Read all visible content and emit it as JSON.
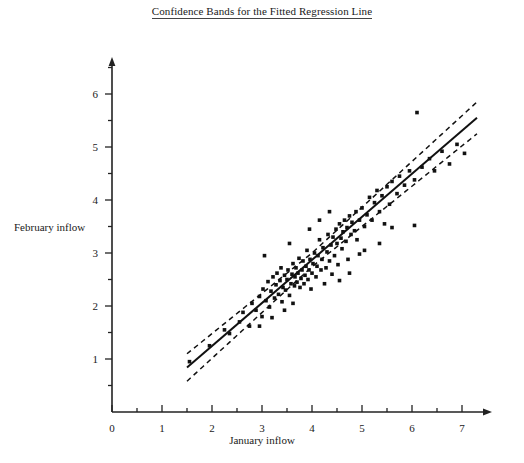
{
  "chart_data": {
    "type": "scatter",
    "title": "Confidence Bands for the Fitted Regression Line",
    "xlabel": "January inflow",
    "ylabel": "February inflow",
    "xlim": [
      0,
      7.6
    ],
    "ylim": [
      0,
      6.7
    ],
    "xticks": [
      0,
      1,
      2,
      3,
      4,
      5,
      6,
      7
    ],
    "yticks": [
      1,
      2,
      3,
      4,
      5,
      6
    ],
    "xminor_step": 0.5,
    "yminor_step": 0.5,
    "grid": false,
    "legend": "none",
    "annotations": [
      "Solid line: fitted least-squares regression line",
      "Dashed lines: confidence bands above and below the fitted line"
    ],
    "fit_line": {
      "name": "Fitted regression line",
      "style": "solid",
      "x_start": 1.5,
      "x_end": 7.3,
      "y_start": 0.84,
      "y_end": 5.55,
      "slope": 0.812,
      "intercept": -0.378
    },
    "confidence_bands": {
      "name": "Confidence bands",
      "style": "dashed",
      "half_width_center": 0.13,
      "half_width_edge": 0.3,
      "x_center": 4.0,
      "upper_y_start": 1.18,
      "upper_y_end": 5.92,
      "lower_y_start": 0.52,
      "lower_y_end": 5.22
    },
    "series": [
      {
        "name": "Inflow observations",
        "marker": "square",
        "color": "#111111",
        "points": [
          [
            1.55,
            0.95
          ],
          [
            1.95,
            1.25
          ],
          [
            2.25,
            1.55
          ],
          [
            2.35,
            1.48
          ],
          [
            2.55,
            1.7
          ],
          [
            2.62,
            1.88
          ],
          [
            2.75,
            1.62
          ],
          [
            2.8,
            2.05
          ],
          [
            2.88,
            1.92
          ],
          [
            2.95,
            2.18
          ],
          [
            3.0,
            1.8
          ],
          [
            3.02,
            2.32
          ],
          [
            3.08,
            2.1
          ],
          [
            3.12,
            2.46
          ],
          [
            3.15,
            1.98
          ],
          [
            3.18,
            2.28
          ],
          [
            3.22,
            2.55
          ],
          [
            3.25,
            2.15
          ],
          [
            3.28,
            2.4
          ],
          [
            3.3,
            2.62
          ],
          [
            3.33,
            2.22
          ],
          [
            3.36,
            2.48
          ],
          [
            3.38,
            2.72
          ],
          [
            3.4,
            2.08
          ],
          [
            3.42,
            2.35
          ],
          [
            3.45,
            2.58
          ],
          [
            3.47,
            2.3
          ],
          [
            3.5,
            2.5
          ],
          [
            3.52,
            2.68
          ],
          [
            3.55,
            2.2
          ],
          [
            3.58,
            2.42
          ],
          [
            3.6,
            2.6
          ],
          [
            3.62,
            2.8
          ],
          [
            3.65,
            2.38
          ],
          [
            3.66,
            2.55
          ],
          [
            3.68,
            2.72
          ],
          [
            3.7,
            2.45
          ],
          [
            3.72,
            2.62
          ],
          [
            3.74,
            2.9
          ],
          [
            3.76,
            2.35
          ],
          [
            3.78,
            2.52
          ],
          [
            3.8,
            2.68
          ],
          [
            3.82,
            2.85
          ],
          [
            3.84,
            2.42
          ],
          [
            3.86,
            2.58
          ],
          [
            3.88,
            2.75
          ],
          [
            3.9,
            3.05
          ],
          [
            3.92,
            2.5
          ],
          [
            3.94,
            2.68
          ],
          [
            3.96,
            2.88
          ],
          [
            3.98,
            2.32
          ],
          [
            4.0,
            2.62
          ],
          [
            4.02,
            2.8
          ],
          [
            4.05,
            3.0
          ],
          [
            4.08,
            2.55
          ],
          [
            4.1,
            2.75
          ],
          [
            4.12,
            2.95
          ],
          [
            4.15,
            3.25
          ],
          [
            4.18,
            2.68
          ],
          [
            4.2,
            2.88
          ],
          [
            4.22,
            3.1
          ],
          [
            4.25,
            2.42
          ],
          [
            4.28,
            2.72
          ],
          [
            4.3,
            3.02
          ],
          [
            4.32,
            3.35
          ],
          [
            4.35,
            2.85
          ],
          [
            4.38,
            3.15
          ],
          [
            4.4,
            2.6
          ],
          [
            4.42,
            3.3
          ],
          [
            4.45,
            2.95
          ],
          [
            4.48,
            3.45
          ],
          [
            4.5,
            3.18
          ],
          [
            4.52,
            2.78
          ],
          [
            4.55,
            3.55
          ],
          [
            4.58,
            3.28
          ],
          [
            4.6,
            3.08
          ],
          [
            4.62,
            3.4
          ],
          [
            4.65,
            3.62
          ],
          [
            4.68,
            3.22
          ],
          [
            4.7,
            3.48
          ],
          [
            4.72,
            2.88
          ],
          [
            4.75,
            3.7
          ],
          [
            4.78,
            3.35
          ],
          [
            4.8,
            3.58
          ],
          [
            4.85,
            3.42
          ],
          [
            4.88,
            3.78
          ],
          [
            4.9,
            3.25
          ],
          [
            4.95,
            3.62
          ],
          [
            5.0,
            3.85
          ],
          [
            5.05,
            3.5
          ],
          [
            5.1,
            3.72
          ],
          [
            5.15,
            4.05
          ],
          [
            5.2,
            3.62
          ],
          [
            5.25,
            3.95
          ],
          [
            5.3,
            4.18
          ],
          [
            5.35,
            3.78
          ],
          [
            5.4,
            4.08
          ],
          [
            5.45,
            3.55
          ],
          [
            5.5,
            4.25
          ],
          [
            5.55,
            3.92
          ],
          [
            5.6,
            4.35
          ],
          [
            5.7,
            4.12
          ],
          [
            5.75,
            4.45
          ],
          [
            5.85,
            4.28
          ],
          [
            5.95,
            4.55
          ],
          [
            6.05,
            4.38
          ],
          [
            6.1,
            5.65
          ],
          [
            6.2,
            4.62
          ],
          [
            6.35,
            4.78
          ],
          [
            6.45,
            4.55
          ],
          [
            6.6,
            4.92
          ],
          [
            6.75,
            4.68
          ],
          [
            6.9,
            5.05
          ],
          [
            7.05,
            4.88
          ],
          [
            5.05,
            3.05
          ],
          [
            5.35,
            3.18
          ],
          [
            4.55,
            2.48
          ],
          [
            4.75,
            2.62
          ],
          [
            3.45,
            1.92
          ],
          [
            3.62,
            2.05
          ],
          [
            2.95,
            1.62
          ],
          [
            4.95,
            2.98
          ],
          [
            5.6,
            3.48
          ],
          [
            6.05,
            3.52
          ],
          [
            3.2,
            1.78
          ],
          [
            3.05,
            2.95
          ],
          [
            3.95,
            3.45
          ],
          [
            4.15,
            3.62
          ],
          [
            4.35,
            3.78
          ],
          [
            3.55,
            3.18
          ]
        ]
      }
    ]
  },
  "axes": {
    "x_arrow": "right-arrow",
    "y_arrow": "up-arrow"
  }
}
